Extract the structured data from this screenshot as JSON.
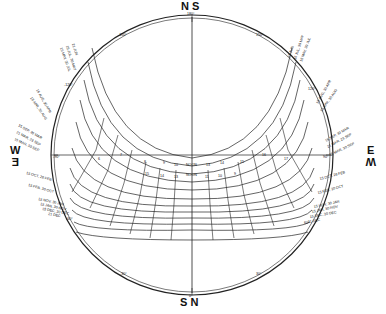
{
  "diagram": {
    "type": "sun-path-diagram",
    "cardinals": {
      "top": "N S",
      "bottom": "S N",
      "left_top": "W",
      "left_bottom": "E",
      "right_top": "E",
      "right_bottom": "W"
    },
    "azimuth_labels": {
      "top": "180°",
      "top_inner": "0°",
      "bottom": "0°",
      "bottom_inner": "180°",
      "upper_left": "-150°",
      "upper_left_inner": "30°",
      "upper_right": "150°",
      "upper_right_inner": "-30°",
      "left_mid": "-90°",
      "left_mid_inner": "90°",
      "right_mid": "90°",
      "right_mid_inner": "-90°",
      "lower_left": "-30°",
      "lower_left_inner": "150°",
      "lower_right": "30°",
      "lower_right_inner": "-150°",
      "left_upper2": "-120°",
      "right_upper2": "120°",
      "left_lower2": "-60°",
      "right_lower2": "60°"
    },
    "noon_label": "NOON",
    "hour_labels_upper": [
      "6",
      "7",
      "8",
      "9",
      "10",
      "11",
      "NOON",
      "13",
      "14",
      "15",
      "16",
      "17",
      "18"
    ],
    "hour_labels_lower": [
      "15",
      "14",
      "13",
      "NOON",
      "11",
      "10",
      "9"
    ],
    "date_labels_right": [
      "21 JUN",
      "15 JUL, 30 MAY",
      "15 MAY, 30 JUL",
      "15 AUG, 30 APR",
      "15 APR, 30 AUG",
      "15 SEP, 30 MAR",
      "21 MAR, 23 SEP",
      "15 MAR, 30 SEP",
      "15 OCT, 28 FEB",
      "15 FEB, 30 OCT",
      "15 NOV, 30 JAN",
      "15 JAN, 30 NOV",
      "15 DEC, 30 DEC",
      "21 DEC"
    ],
    "date_labels_left": [
      "21 JUN",
      "15 JUL, 30 MAY",
      "15 MAY, 30 JUL",
      "15 AUG, 30 APR",
      "15 APR, 30 AUG",
      "15 SEP, 30 MAR",
      "21 MAR, 23 SEP",
      "15 MAR, 30 SEP",
      "15 OCT, 28 FEB",
      "15 FEB, 30 OCT",
      "15 NOV, 30 JAN",
      "15 JAN, 30 NOV",
      "15 DEC, 30 DEC",
      "21 DEC"
    ],
    "colors": {
      "ink": "#222222",
      "background": "#ffffff"
    }
  }
}
